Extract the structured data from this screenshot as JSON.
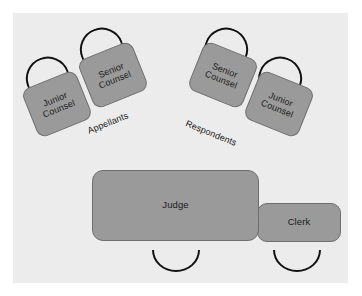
{
  "diagram": {
    "floor_color": "#ececec",
    "desk_color": "#9a9a9a",
    "desk_border_color": "#6f6f6f",
    "chair_color": "#121212",
    "text_color": "#1a1a1a"
  },
  "groups": {
    "appellants": {
      "label": "Appellants",
      "junior_label": "Junior\nCounsel",
      "senior_label": "Senior\nCounsel"
    },
    "respondents": {
      "label": "Respondents",
      "senior_label": "Senior\nCounsel",
      "junior_label": "Junior\nCounsel"
    }
  },
  "bench": {
    "judge_label": "Judge",
    "clerk_label": "Clerk"
  }
}
